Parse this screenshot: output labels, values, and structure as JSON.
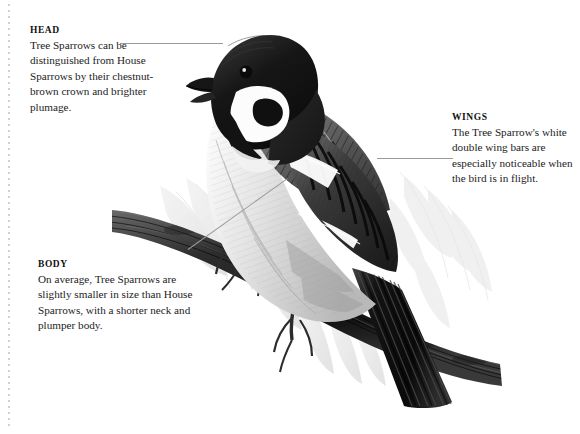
{
  "page": {
    "background_color": "#ffffff",
    "width": 580,
    "height": 434,
    "edge_rule_color": "#c9c9c9"
  },
  "illustration": {
    "subject": "tree-sparrow-perched-on-branch",
    "style": "graphite-pencil-field-guide-illustration",
    "palette": {
      "crown": "#1d1d1d",
      "cheek_patch": "#141414",
      "cheek": "#fbfbfb",
      "mantle": "#4a4a4a",
      "wing_dark": "#232323",
      "wing_bar": "#ffffff",
      "breast": "#cfcfcf",
      "branch": "#2b2b2b",
      "foliage": "#d8d8d8",
      "tail": "#1b1b1b"
    },
    "elements": [
      "head-crown",
      "eye",
      "beak",
      "cheek-spot",
      "throat-bib",
      "double-wing-bars",
      "folded-wing",
      "breast",
      "legs-gripping-branch",
      "long-tail",
      "willow-branch",
      "background-leaves"
    ]
  },
  "callouts": {
    "head": {
      "title": "HEAD",
      "text": "Tree Sparrows can be distinguished from House Sparrows by their chestnut-brown crown and brighter plumage."
    },
    "wings": {
      "title": "WINGS",
      "text": "The Tree Sparrow's white double wing bars are especially noticeable when the bird is in flight."
    },
    "body": {
      "title": "BODY",
      "text": "On average, Tree Sparrows are slightly smaller in size than House Sparrows, with a shorter neck and plumper body."
    }
  },
  "leaders": {
    "head_line_color": "#9a9a9a",
    "wings_line_color": "#9a9a9a",
    "body_line_color": "#9a9a9a"
  }
}
